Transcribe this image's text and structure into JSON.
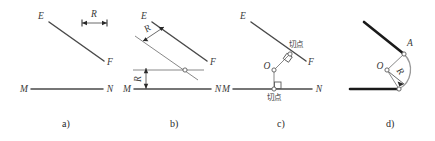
{
  "figure": {
    "colors": {
      "given_line": "#4a4a4a",
      "heavy_line": "#1a1a1a",
      "construction_line": "#7a7a7a",
      "arc": "#9a9a9a",
      "text": "#3a3a3a",
      "background": "#ffffff"
    },
    "panels": [
      {
        "id": "a",
        "caption": "a)",
        "labels": {
          "line1_start": "E",
          "line1_end": "F",
          "line2_start": "M",
          "line2_end": "N",
          "radius": "R"
        }
      },
      {
        "id": "b",
        "caption": "b)",
        "labels": {
          "line1_start": "E",
          "line1_end": "F",
          "line2_start": "M",
          "line2_end": "N",
          "offset1": "R",
          "offset2": "R"
        }
      },
      {
        "id": "c",
        "caption": "c)",
        "labels": {
          "line1_start": "E",
          "line1_end": "F",
          "line2_start": "M",
          "line2_end": "N",
          "center": "O",
          "tangent_point_upper": "切点",
          "tangent_point_lower": "切点"
        }
      },
      {
        "id": "d",
        "caption": "d)",
        "labels": {
          "center": "O",
          "radius": "R",
          "tangent_point": "A"
        }
      }
    ]
  }
}
